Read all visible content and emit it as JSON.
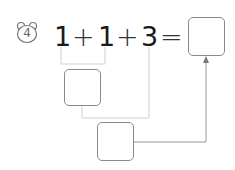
{
  "problem": {
    "number": "4",
    "icon": "bear-face-icon",
    "expression": [
      "1",
      "+",
      "1",
      "+",
      "3",
      "="
    ]
  },
  "colors": {
    "text": "#1a1a1a",
    "box_border": "#8a8a8a",
    "connector": "#c8c8c8",
    "arrow": "#999999"
  }
}
